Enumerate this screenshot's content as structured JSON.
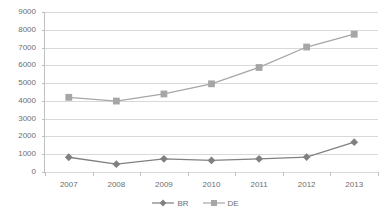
{
  "chart_data": {
    "type": "line",
    "title": "",
    "xlabel": "",
    "ylabel": "",
    "categories": [
      "2007",
      "2008",
      "2009",
      "2010",
      "2011",
      "2012",
      "2013"
    ],
    "series": [
      {
        "name": "BR",
        "marker": "diamond",
        "color": "#808080",
        "values": [
          830,
          440,
          740,
          650,
          740,
          840,
          1680
        ]
      },
      {
        "name": "DE",
        "marker": "square",
        "color": "#a6a6a6",
        "values": [
          4200,
          3990,
          4390,
          4960,
          5880,
          7030,
          7750
        ]
      }
    ],
    "ylim": [
      0,
      9000
    ],
    "y_ticks": [
      "0",
      "1000",
      "2000",
      "3000",
      "4000",
      "5000",
      "6000",
      "7000",
      "8000",
      "9000"
    ],
    "y_tick_values": [
      0,
      1000,
      2000,
      3000,
      4000,
      5000,
      6000,
      7000,
      8000,
      9000
    ],
    "grid": true,
    "grid_color": "#d9d9d9",
    "axis_color": "#bfbfbf",
    "legend_position": "bottom",
    "legend": [
      "BR",
      "DE"
    ]
  }
}
